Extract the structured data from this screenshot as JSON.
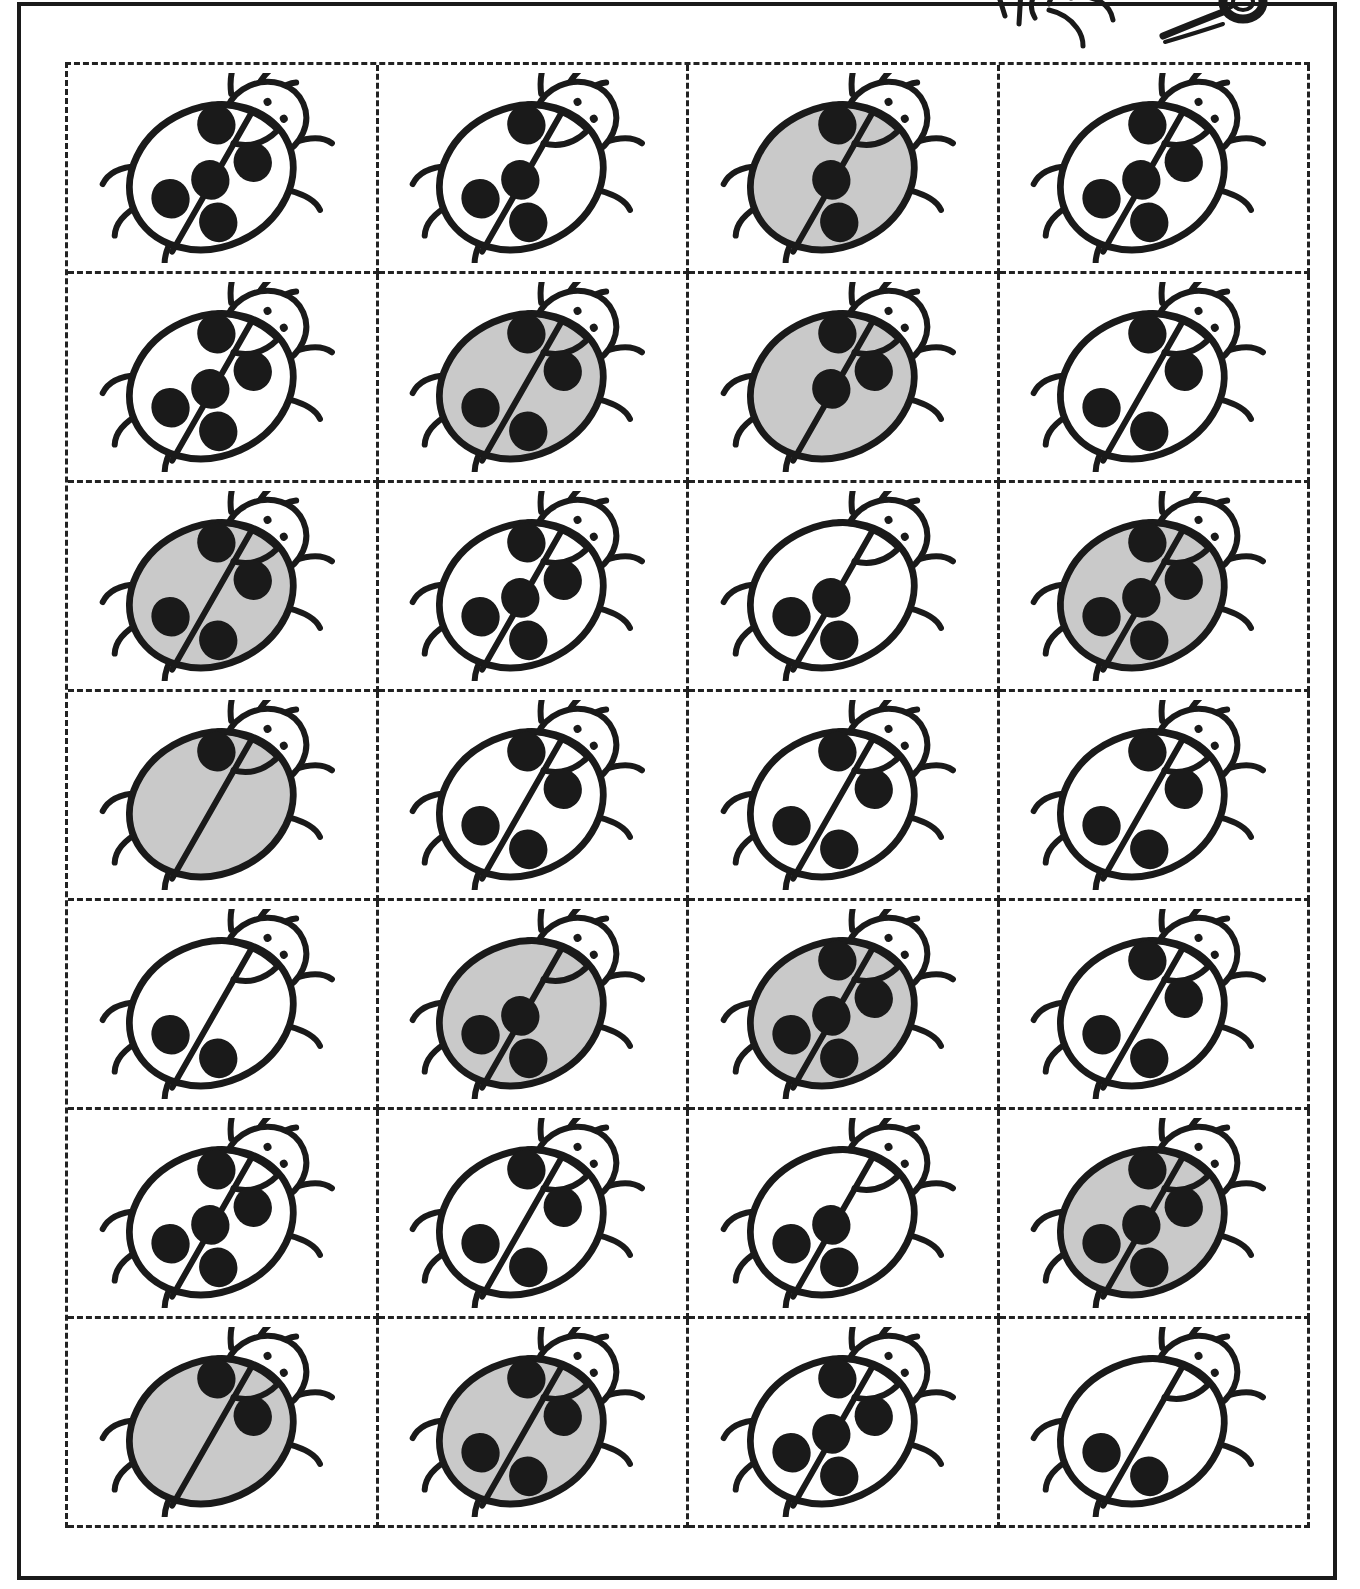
{
  "worksheet": {
    "title": "Ladybug Cut-Out Cards Worksheet",
    "kind": "cut-and-sort activity sheet",
    "grid": {
      "rows": 7,
      "columns": 4,
      "total_cards": 28
    },
    "cut_line_style": "dashed",
    "border_style": "solid",
    "decoration": {
      "name": "hand-with-scissors",
      "label": "Hand holding scissors (cut here)",
      "position": "top-right, partially cropped"
    }
  },
  "colors": {
    "ink": "#1a1a1a",
    "body_white": "#ffffff",
    "body_gray": "#c9c9c9",
    "spot_black": "#1a1a1a",
    "page_background": "#ffffff",
    "cut_line": "#222222"
  },
  "spot_positions": {
    "top": "upper wing, near head",
    "left": "left wing, middle",
    "center": "on the wing seam, middle",
    "right": "right wing, middle",
    "bottom": "lower wing, below seam"
  },
  "cards": [
    {
      "id": "r1c1",
      "row": 1,
      "col": 1,
      "body_color": "white",
      "spot_count": 5,
      "spots": [
        "top",
        "left",
        "center",
        "right",
        "bottom"
      ]
    },
    {
      "id": "r1c2",
      "row": 1,
      "col": 2,
      "body_color": "white",
      "spot_count": 4,
      "spots": [
        "top",
        "left",
        "center",
        "bottom"
      ]
    },
    {
      "id": "r1c3",
      "row": 1,
      "col": 3,
      "body_color": "gray",
      "spot_count": 3,
      "spots": [
        "top",
        "center",
        "bottom"
      ]
    },
    {
      "id": "r1c4",
      "row": 1,
      "col": 4,
      "body_color": "white",
      "spot_count": 5,
      "spots": [
        "top",
        "left",
        "center",
        "right",
        "bottom"
      ]
    },
    {
      "id": "r2c1",
      "row": 2,
      "col": 1,
      "body_color": "white",
      "spot_count": 5,
      "spots": [
        "top",
        "left",
        "center",
        "right",
        "bottom"
      ]
    },
    {
      "id": "r2c2",
      "row": 2,
      "col": 2,
      "body_color": "gray",
      "spot_count": 4,
      "spots": [
        "top",
        "left",
        "right",
        "bottom"
      ]
    },
    {
      "id": "r2c3",
      "row": 2,
      "col": 3,
      "body_color": "gray",
      "spot_count": 3,
      "spots": [
        "top",
        "center",
        "right"
      ]
    },
    {
      "id": "r2c4",
      "row": 2,
      "col": 4,
      "body_color": "white",
      "spot_count": 4,
      "spots": [
        "top",
        "left",
        "right",
        "bottom"
      ]
    },
    {
      "id": "r3c1",
      "row": 3,
      "col": 1,
      "body_color": "gray",
      "spot_count": 4,
      "spots": [
        "top",
        "left",
        "right",
        "bottom"
      ]
    },
    {
      "id": "r3c2",
      "row": 3,
      "col": 2,
      "body_color": "white",
      "spot_count": 5,
      "spots": [
        "top",
        "left",
        "center",
        "right",
        "bottom"
      ]
    },
    {
      "id": "r3c3",
      "row": 3,
      "col": 3,
      "body_color": "white",
      "spot_count": 3,
      "spots": [
        "left",
        "center",
        "bottom"
      ]
    },
    {
      "id": "r3c4",
      "row": 3,
      "col": 4,
      "body_color": "gray",
      "spot_count": 5,
      "spots": [
        "top",
        "left",
        "center",
        "right",
        "bottom"
      ]
    },
    {
      "id": "r4c1",
      "row": 4,
      "col": 1,
      "body_color": "gray",
      "spot_count": 1,
      "spots": [
        "top"
      ]
    },
    {
      "id": "r4c2",
      "row": 4,
      "col": 2,
      "body_color": "white",
      "spot_count": 4,
      "spots": [
        "top",
        "left",
        "right",
        "bottom"
      ]
    },
    {
      "id": "r4c3",
      "row": 4,
      "col": 3,
      "body_color": "white",
      "spot_count": 4,
      "spots": [
        "top",
        "left",
        "right",
        "bottom"
      ]
    },
    {
      "id": "r4c4",
      "row": 4,
      "col": 4,
      "body_color": "white",
      "spot_count": 4,
      "spots": [
        "top",
        "left",
        "right",
        "bottom"
      ]
    },
    {
      "id": "r5c1",
      "row": 5,
      "col": 1,
      "body_color": "white",
      "spot_count": 2,
      "spots": [
        "left",
        "bottom"
      ]
    },
    {
      "id": "r5c2",
      "row": 5,
      "col": 2,
      "body_color": "gray",
      "spot_count": 3,
      "spots": [
        "left",
        "center",
        "bottom"
      ]
    },
    {
      "id": "r5c3",
      "row": 5,
      "col": 3,
      "body_color": "gray",
      "spot_count": 5,
      "spots": [
        "top",
        "left",
        "center",
        "right",
        "bottom"
      ]
    },
    {
      "id": "r5c4",
      "row": 5,
      "col": 4,
      "body_color": "white",
      "spot_count": 4,
      "spots": [
        "top",
        "left",
        "right",
        "bottom"
      ]
    },
    {
      "id": "r6c1",
      "row": 6,
      "col": 1,
      "body_color": "white",
      "spot_count": 5,
      "spots": [
        "top",
        "left",
        "center",
        "right",
        "bottom"
      ]
    },
    {
      "id": "r6c2",
      "row": 6,
      "col": 2,
      "body_color": "white",
      "spot_count": 4,
      "spots": [
        "top",
        "left",
        "right",
        "bottom"
      ]
    },
    {
      "id": "r6c3",
      "row": 6,
      "col": 3,
      "body_color": "white",
      "spot_count": 3,
      "spots": [
        "left",
        "center",
        "bottom"
      ]
    },
    {
      "id": "r6c4",
      "row": 6,
      "col": 4,
      "body_color": "gray",
      "spot_count": 5,
      "spots": [
        "top",
        "left",
        "center",
        "right",
        "bottom"
      ]
    },
    {
      "id": "r7c1",
      "row": 7,
      "col": 1,
      "body_color": "gray",
      "spot_count": 2,
      "spots": [
        "top",
        "right"
      ]
    },
    {
      "id": "r7c2",
      "row": 7,
      "col": 2,
      "body_color": "gray",
      "spot_count": 4,
      "spots": [
        "top",
        "left",
        "right",
        "bottom"
      ]
    },
    {
      "id": "r7c3",
      "row": 7,
      "col": 3,
      "body_color": "white",
      "spot_count": 5,
      "spots": [
        "top",
        "left",
        "center",
        "right",
        "bottom"
      ]
    },
    {
      "id": "r7c4",
      "row": 7,
      "col": 4,
      "body_color": "white",
      "spot_count": 2,
      "spots": [
        "left",
        "bottom"
      ]
    }
  ]
}
